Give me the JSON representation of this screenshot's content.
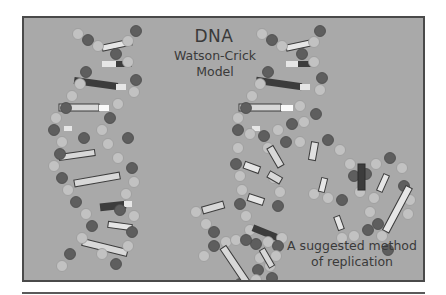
{
  "figure": {
    "title": "DNA",
    "subtitle_line1": "Watson-Crick",
    "subtitle_line2": "Model",
    "caption_line1": "A suggested method",
    "caption_line2": "of replication"
  },
  "colors": {
    "background": "#a9a9a9",
    "frame": "#4a4a4a",
    "light_nucleotide": "#c2c2c2",
    "dark_nucleotide": "#5e5e5e",
    "base_light": "#e6e6e6",
    "base_dark": "#3c3c3c",
    "text": "#3a3a3a"
  },
  "elements": {
    "helices": [
      "intact-helix-left",
      "replicating-helix-right"
    ]
  }
}
